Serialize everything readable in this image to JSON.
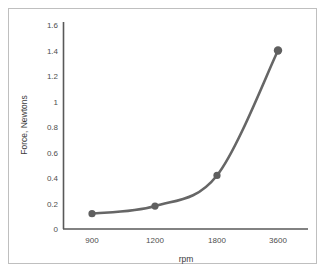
{
  "chart_data": {
    "type": "line",
    "title": "",
    "subtitle": "",
    "xlabel": "rpm",
    "ylabel": "Force, Newtons",
    "categories": [
      "900",
      "1200",
      "1800",
      "3600"
    ],
    "x": [
      900,
      1200,
      1800,
      3600
    ],
    "values": [
      0.12,
      0.18,
      0.42,
      1.4
    ],
    "series": [
      {
        "name": "Force",
        "values": [
          0.12,
          0.18,
          0.42,
          1.4
        ]
      }
    ],
    "ylim": [
      0,
      1.6
    ],
    "yticks": [
      "0",
      "0.2",
      "0.4",
      "0.6",
      "0.8",
      "1",
      "1.2",
      "1.4",
      "1.6"
    ],
    "ytick_values": [
      0,
      0.2,
      0.4,
      0.6,
      0.8,
      1,
      1.2,
      1.4,
      1.6
    ],
    "xticks": [
      "900",
      "1200",
      "1800",
      "3600"
    ],
    "grid": false,
    "legend": false,
    "legend_position": "none",
    "marker": "circle",
    "line_color": "#666666",
    "marker_color": "#5f5f5f",
    "axis_color": "#595959",
    "frame_color": "#bfbfbf",
    "background": "#ffffff"
  }
}
